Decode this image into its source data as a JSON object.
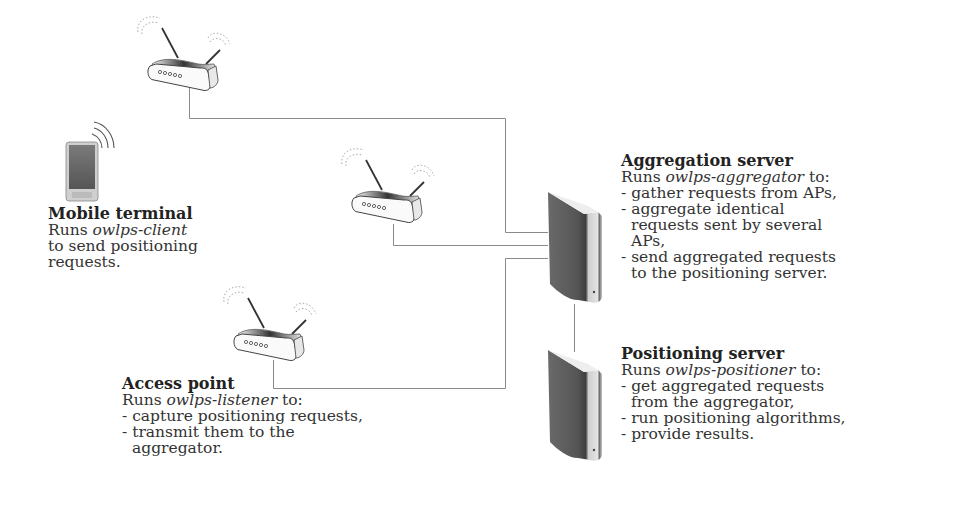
{
  "nodes": {
    "mobile_terminal": {
      "title": "Mobile terminal",
      "runs_prefix": "Runs ",
      "program": "owlps-client",
      "lines": [
        "to send positioning",
        "requests."
      ]
    },
    "access_point": {
      "title": "Access point",
      "runs_prefix": "Runs ",
      "program": "owlps-listener",
      "runs_suffix": " to:",
      "lines": [
        "- capture positioning requests,",
        "- transmit them to the",
        "aggregator."
      ]
    },
    "aggregation_server": {
      "title": "Aggregation server",
      "runs_prefix": "Runs ",
      "program": "owlps-aggregator",
      "runs_suffix": " to:",
      "lines": [
        "- gather requests from APs,",
        "- aggregate identical",
        "requests sent by several",
        "APs,",
        "- send aggregated requests",
        "to the positioning server."
      ]
    },
    "positioning_server": {
      "title": "Positioning server",
      "runs_prefix": "Runs ",
      "program": "owlps-positioner",
      "runs_suffix": " to:",
      "lines": [
        "- get aggregated requests",
        "from the aggregator,",
        "- run positioning algorithms,",
        "- provide results."
      ]
    }
  },
  "icons": {
    "mobile": "mobile-phone-icon",
    "access_point": "wifi-router-icon",
    "server": "server-tower-icon"
  },
  "colors": {
    "line": "#8a8a8a",
    "server_dark": "#5e5e5e",
    "server_light": "#d8d8d8",
    "text": "#333333"
  }
}
